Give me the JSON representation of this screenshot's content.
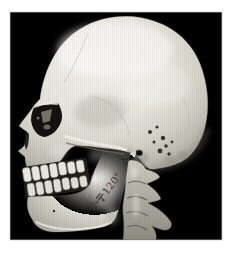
{
  "figure": {
    "annotation": {
      "text": "小于120°",
      "text_cjk": "小于",
      "text_ascii": "120°",
      "rotation_deg": -53,
      "color": "#3c3e33"
    },
    "colors": {
      "render_background": "#000000",
      "page_margin": "#ffffff",
      "bone_light": "#f3f1ea",
      "bone_mid": "#d6d3c9",
      "bone_dark": "#9b988e"
    }
  }
}
